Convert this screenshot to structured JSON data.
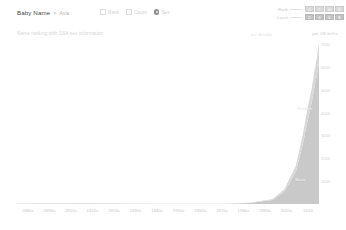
{
  "header": {
    "breadcrumb_root": "Baby Name",
    "breadcrumb_separator": ">",
    "breadcrumb_current": "Ava",
    "toolbar": {
      "items": [
        {
          "label": "Rank",
          "icon": "checkbox-icon"
        },
        {
          "label": "Count",
          "icon": "checkbox-icon"
        }
      ],
      "selected_icon": "radio-selected-icon",
      "selected_label": "Sex"
    },
    "stats": {
      "rows": [
        {
          "name": "Rank",
          "cells": [
            "4",
            "1",
            "8",
            "9"
          ]
        },
        {
          "name": "Count",
          "cells": [
            "2",
            "4",
            "5",
            "8"
          ]
        }
      ]
    }
  },
  "subtitle": {
    "text": "Name ranking with SSA sex information",
    "series_caption": "per decade",
    "axis_note": "per 1M births"
  },
  "chart_data": {
    "type": "area",
    "title": "Name ranking with SSA sex information",
    "xlabel": "",
    "ylabel": "per 1M births",
    "grid": false,
    "legend_position": "inside",
    "xlim": [
      1880,
      2010
    ],
    "ylim": [
      0,
      7000
    ],
    "x": [
      1880,
      1890,
      1900,
      1910,
      1920,
      1930,
      1940,
      1950,
      1960,
      1970,
      1980,
      1990,
      1995,
      2000,
      2003,
      2005,
      2007,
      2008,
      2009,
      2010
    ],
    "xticks": [
      "1880s",
      "1890s",
      "1900s",
      "1910s",
      "1920s",
      "1930s",
      "1940s",
      "1950s",
      "1960s",
      "1970s",
      "1980s",
      "1990s",
      "2000s",
      "2010"
    ],
    "yticks": [
      "1000",
      "2000",
      "3000",
      "4000",
      "5000",
      "6000",
      "7000"
    ],
    "series": [
      {
        "name": "Female",
        "color": "#c9c9c9",
        "values": [
          15,
          18,
          20,
          22,
          20,
          16,
          12,
          10,
          9,
          12,
          40,
          180,
          520,
          1400,
          2600,
          3600,
          4500,
          5100,
          5600,
          6200
        ]
      },
      {
        "name": "Male",
        "color": "#d8d8d8",
        "values": [
          4,
          5,
          5,
          6,
          5,
          4,
          3,
          3,
          3,
          4,
          10,
          40,
          110,
          260,
          420,
          540,
          640,
          700,
          760,
          820
        ]
      }
    ],
    "annotations": [
      {
        "text": "Female",
        "x": 2004,
        "y": 4200
      },
      {
        "text": "Male",
        "x": 2002,
        "y": 1100
      }
    ]
  }
}
